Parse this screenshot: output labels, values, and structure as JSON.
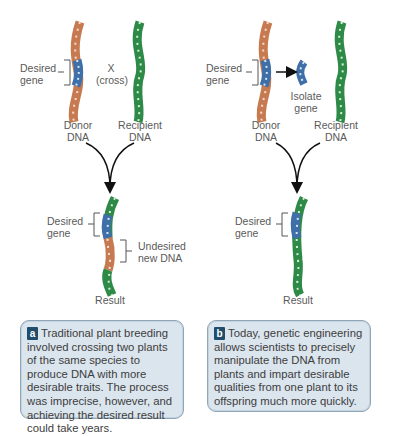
{
  "panel_a": {
    "desired_gene_top": "Desired\ngene",
    "cross_x": "X",
    "cross_label": "(cross)",
    "donor_dna": "Donor\nDNA",
    "recipient_dna": "Recipient\nDNA",
    "desired_gene_result": "Desired\ngene",
    "undesired_new_dna": "Undesired\nnew DNA",
    "result": "Result",
    "caption_letter": "a",
    "caption_text": "Traditional plant breeding involved crossing two plants of the same species to produce DNA with more desirable traits. The process was imprecise, however, and achieving the desired result could take years."
  },
  "panel_b": {
    "desired_gene_top": "Desired\ngene",
    "isolate_gene": "Isolate\ngene",
    "donor_dna": "Donor\nDNA",
    "recipient_dna": "Recipient\nDNA",
    "desired_gene_result": "Desired\ngene",
    "result": "Result",
    "caption_letter": "b",
    "caption_text": "Today, genetic engineering allows scientists to precisely manipulate the DNA from plants and impart desirable qualities from one plant to its offspring much more quickly."
  },
  "colors": {
    "donor_strand": "#b5673e",
    "gene_strand": "#3f6fa8",
    "recipient_strand": "#2e8a47",
    "caption_bg": "#dbe5ee",
    "caption_border": "#8fa6b8",
    "badge_bg": "#1f4e6c"
  }
}
